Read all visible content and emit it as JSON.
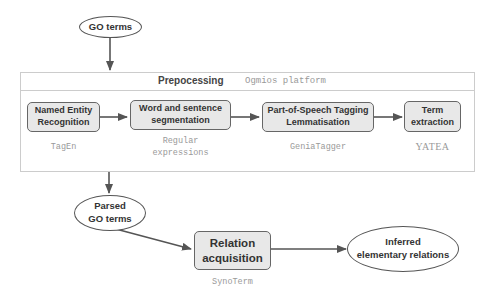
{
  "diagram": {
    "input_node": {
      "label": "GO terms"
    },
    "preprocessing": {
      "title": "Prepocessing",
      "platform": "Ogmios platform",
      "steps": [
        {
          "label_line1": "Named Entity",
          "label_line2": "Recognition",
          "tool_line1": "TagEn",
          "tool_line2": ""
        },
        {
          "label_line1": "Word and sentence",
          "label_line2": "segmentation",
          "tool_line1": "Regular",
          "tool_line2": "expressions"
        },
        {
          "label_line1": "Part-of-Speech Tagging",
          "label_line2": "Lemmatisation",
          "tool_line1": "GeniaTagger",
          "tool_line2": ""
        },
        {
          "label_line1": "Term",
          "label_line2": "extraction",
          "tool_line1": "YATEA",
          "tool_line2": ""
        }
      ]
    },
    "parsed_node": {
      "label_line1": "Parsed",
      "label_line2": "GO terms"
    },
    "relation_step": {
      "label_line1": "Relation",
      "label_line2": "acquisition",
      "tool": "SynoTerm"
    },
    "output_node": {
      "label_line1": "Inferred",
      "label_line2": "elementary relations"
    },
    "colors": {
      "box_fill": "#e8e8e8",
      "stroke": "#555555",
      "tool_text": "#999999"
    }
  }
}
